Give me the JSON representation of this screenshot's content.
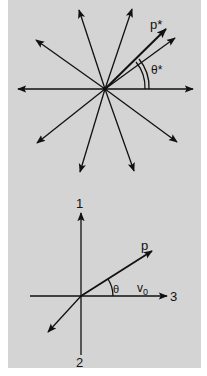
{
  "figure": {
    "background_color": "#d4d4d4",
    "line_color": "#111111",
    "top_diagram": {
      "description": "Isotropic momentum vectors in CM frame",
      "labels": {
        "momentum": "p*",
        "angle": "θ*"
      },
      "center": [
        105,
        89
      ],
      "vector_tips": [
        [
          193,
          89
        ],
        [
          18,
          89
        ],
        [
          79,
          10
        ],
        [
          132,
          9
        ],
        [
          36,
          40
        ],
        [
          37,
          143
        ],
        [
          80,
          172
        ],
        [
          134,
          171
        ],
        [
          177,
          142
        ],
        [
          175,
          38
        ]
      ],
      "highlighted_vector_tip": [
        166,
        29
      ]
    },
    "bottom_diagram": {
      "description": "Lab frame axes with momentum p at angle θ to velocity v0",
      "labels": {
        "axis_1": "1",
        "axis_2": "2",
        "axis_3": "3",
        "momentum": "p",
        "angle": "θ",
        "velocity": "v",
        "velocity_subscript": "0"
      },
      "origin": [
        81,
        296
      ]
    }
  }
}
